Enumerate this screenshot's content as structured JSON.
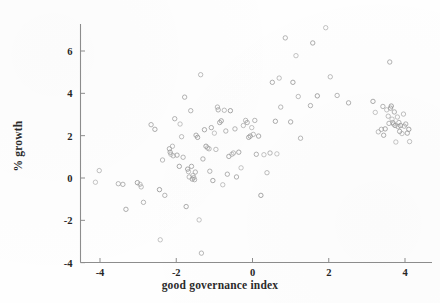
{
  "chart_data": {
    "type": "scatter",
    "title": "",
    "xlabel": "good governance index",
    "ylabel": "% growth",
    "xlim": [
      -4.6,
      4.6
    ],
    "ylim": [
      -4.2,
      7.4
    ],
    "xticks": [
      -4,
      -2,
      0,
      2,
      4
    ],
    "yticks": [
      -4,
      -2,
      0,
      2,
      4,
      6
    ],
    "xtick_labels": [
      "-4",
      "-2",
      "0",
      "2",
      "4"
    ],
    "ytick_labels": [
      "-4",
      "-2",
      "0",
      "2",
      "4",
      "6"
    ],
    "grid": false,
    "legend": null,
    "marker": {
      "shape": "open-circle",
      "size_px": 4.4,
      "edge_color": "#9a9a9a",
      "fill_color": "none",
      "line_width": 0.9
    },
    "axis_color": "#8d8d8d",
    "text_color": "#262626",
    "background": "#fefefe",
    "n_points": 131,
    "points": [
      [
        -4.12,
        -0.2
      ],
      [
        -4.02,
        0.35
      ],
      [
        -3.52,
        -0.27
      ],
      [
        -3.4,
        -0.3
      ],
      [
        -3.32,
        -1.48
      ],
      [
        -3.02,
        -0.22
      ],
      [
        -2.95,
        -0.3
      ],
      [
        -2.92,
        -0.42
      ],
      [
        -2.86,
        -1.15
      ],
      [
        -2.66,
        2.52
      ],
      [
        -2.56,
        2.3
      ],
      [
        -2.44,
        -0.55
      ],
      [
        -2.42,
        -2.92
      ],
      [
        -2.36,
        0.85
      ],
      [
        -2.3,
        -0.82
      ],
      [
        -2.18,
        1.38
      ],
      [
        -2.16,
        1.22
      ],
      [
        -2.14,
        1.12
      ],
      [
        -2.1,
        1.5
      ],
      [
        -2.08,
        1.05
      ],
      [
        -2.04,
        2.8
      ],
      [
        -1.98,
        1.08
      ],
      [
        -1.92,
        0.55
      ],
      [
        -1.9,
        2.55
      ],
      [
        -1.86,
        1.95
      ],
      [
        -1.82,
        0.98
      ],
      [
        -1.78,
        3.82
      ],
      [
        -1.74,
        -1.35
      ],
      [
        -1.7,
        0.42
      ],
      [
        -1.68,
        0.3
      ],
      [
        -1.66,
        0.05
      ],
      [
        -1.62,
        3.18
      ],
      [
        -1.6,
        0.55
      ],
      [
        -1.58,
        -0.05
      ],
      [
        -1.56,
        0.12
      ],
      [
        -1.54,
        0.02
      ],
      [
        -1.52,
        -0.08
      ],
      [
        -1.5,
        0.28
      ],
      [
        -1.48,
        2.02
      ],
      [
        -1.44,
        1.92
      ],
      [
        -1.4,
        -1.98
      ],
      [
        -1.36,
        4.88
      ],
      [
        -1.34,
        -3.55
      ],
      [
        -1.3,
        0.9
      ],
      [
        -1.26,
        2.28
      ],
      [
        -1.22,
        1.5
      ],
      [
        -1.18,
        1.42
      ],
      [
        -1.14,
        1.38
      ],
      [
        -1.12,
        0.32
      ],
      [
        -1.08,
        2.38
      ],
      [
        -1.04,
        -0.12
      ],
      [
        -1.0,
        2.12
      ],
      [
        -0.96,
        1.35
      ],
      [
        -0.92,
        3.35
      ],
      [
        -0.9,
        3.22
      ],
      [
        -0.86,
        2.62
      ],
      [
        -0.82,
        2.7
      ],
      [
        -0.78,
        -0.32
      ],
      [
        -0.74,
        3.2
      ],
      [
        -0.7,
        2.22
      ],
      [
        -0.66,
        0.18
      ],
      [
        -0.62,
        1.02
      ],
      [
        -0.58,
        3.18
      ],
      [
        -0.54,
        1.12
      ],
      [
        -0.5,
        1.18
      ],
      [
        -0.46,
        2.32
      ],
      [
        -0.42,
        0.05
      ],
      [
        -0.36,
        1.22
      ],
      [
        -0.3,
        0.48
      ],
      [
        -0.24,
        2.48
      ],
      [
        -0.18,
        2.72
      ],
      [
        -0.14,
        2.62
      ],
      [
        -0.1,
        1.92
      ],
      [
        -0.06,
        1.98
      ],
      [
        -0.02,
        2.38
      ],
      [
        0.02,
        2.06
      ],
      [
        0.06,
        2.72
      ],
      [
        0.1,
        1.12
      ],
      [
        0.16,
        1.98
      ],
      [
        0.22,
        -0.82
      ],
      [
        0.3,
        1.1
      ],
      [
        0.38,
        0.25
      ],
      [
        0.46,
        1.18
      ],
      [
        0.52,
        4.52
      ],
      [
        0.6,
        2.68
      ],
      [
        0.64,
        1.14
      ],
      [
        0.7,
        4.72
      ],
      [
        0.74,
        3.35
      ],
      [
        0.86,
        6.62
      ],
      [
        1.0,
        2.65
      ],
      [
        1.06,
        4.52
      ],
      [
        1.14,
        5.78
      ],
      [
        1.2,
        3.85
      ],
      [
        1.26,
        1.88
      ],
      [
        1.52,
        3.42
      ],
      [
        1.58,
        6.38
      ],
      [
        1.7,
        3.88
      ],
      [
        1.92,
        7.1
      ],
      [
        2.04,
        4.78
      ],
      [
        2.22,
        3.9
      ],
      [
        2.52,
        3.55
      ],
      [
        3.16,
        3.62
      ],
      [
        3.22,
        3.1
      ],
      [
        3.3,
        2.18
      ],
      [
        3.38,
        2.3
      ],
      [
        3.42,
        3.38
      ],
      [
        3.44,
        2.02
      ],
      [
        3.48,
        2.32
      ],
      [
        3.52,
        3.22
      ],
      [
        3.56,
        2.92
      ],
      [
        3.58,
        2.58
      ],
      [
        3.6,
        5.48
      ],
      [
        3.62,
        3.3
      ],
      [
        3.64,
        3.4
      ],
      [
        3.66,
        2.78
      ],
      [
        3.68,
        2.62
      ],
      [
        3.7,
        2.55
      ],
      [
        3.72,
        3.12
      ],
      [
        3.74,
        2.48
      ],
      [
        3.76,
        1.7
      ],
      [
        3.8,
        2.88
      ],
      [
        3.82,
        2.42
      ],
      [
        3.84,
        2.62
      ],
      [
        3.86,
        2.2
      ],
      [
        3.88,
        2.48
      ],
      [
        3.92,
        2.1
      ],
      [
        3.96,
        3.02
      ],
      [
        3.98,
        2.45
      ],
      [
        4.02,
        2.55
      ],
      [
        4.06,
        2.12
      ],
      [
        4.1,
        2.3
      ],
      [
        4.12,
        1.72
      ]
    ]
  }
}
